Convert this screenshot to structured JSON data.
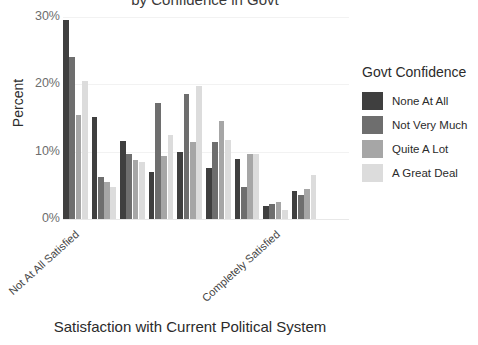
{
  "chart_data": {
    "type": "bar",
    "title": "by Confidence in Govt",
    "xlabel": "Satisfaction with Current Political System",
    "ylabel": "Percent",
    "ylim": [
      0,
      30
    ],
    "yticks": [
      "0%",
      "10%",
      "20%",
      "30%"
    ],
    "ytick_values": [
      0,
      10,
      20,
      30
    ],
    "grid": false,
    "legend_position": "right",
    "legend_title": "Govt Confidence",
    "categories": [
      "0",
      "1",
      "2",
      "3",
      "4",
      "5",
      "6",
      "7",
      "8",
      "9"
    ],
    "xtick_labels": [
      "Not At All Satisfied",
      "Completely Satisfied"
    ],
    "xtick_label_positions": [
      0,
      7
    ],
    "series": [
      {
        "name": "None At All",
        "color": "#3f3f3f",
        "values": [
          29.5,
          15.1,
          11.6,
          7.0,
          10.0,
          7.6,
          8.9,
          1.9,
          4.2,
          0.0
        ]
      },
      {
        "name": "Not Very Much",
        "color": "#6e6e6e",
        "values": [
          24.0,
          6.3,
          9.7,
          17.2,
          18.6,
          11.5,
          4.8,
          2.2,
          3.5,
          0.0
        ]
      },
      {
        "name": "Quite A Lot",
        "color": "#a6a6a6",
        "values": [
          15.4,
          5.5,
          8.8,
          9.3,
          11.5,
          14.5,
          9.6,
          2.5,
          4.4,
          0.0
        ]
      },
      {
        "name": "A Great Deal",
        "color": "#dcdcdc",
        "values": [
          20.5,
          4.7,
          8.4,
          12.5,
          19.8,
          11.7,
          9.6,
          1.3,
          6.6,
          0.0
        ]
      }
    ]
  }
}
